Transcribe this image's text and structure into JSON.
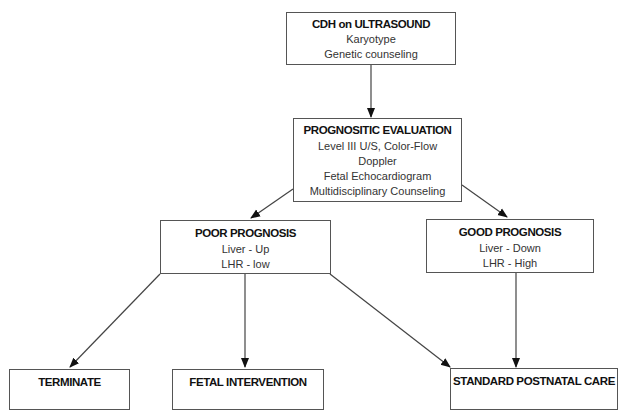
{
  "diagram": {
    "nodes": {
      "cdh": {
        "title": "CDH on ULTRASOUND",
        "lines": [
          "Karyotype",
          "Genetic counseling"
        ]
      },
      "evaluation": {
        "title": "PROGNOSITIC EVALUATION",
        "lines": [
          "Level III U/S, Color-Flow",
          "Doppler",
          "Fetal Echocardiogram",
          "Multidisciplinary Counseling"
        ]
      },
      "poor": {
        "title": "POOR PROGNOSIS",
        "lines": [
          "Liver - Up",
          "LHR - low"
        ]
      },
      "good": {
        "title": "GOOD PROGNOSIS",
        "lines": [
          "Liver - Down",
          "LHR - High"
        ]
      },
      "terminate": {
        "title": "TERMINATE"
      },
      "fetal_intervention": {
        "title": "FETAL INTERVENTION"
      },
      "postnatal": {
        "title": "STANDARD POSTNATAL CARE"
      }
    },
    "edges": [
      {
        "from": "cdh",
        "to": "evaluation"
      },
      {
        "from": "evaluation",
        "to": "poor"
      },
      {
        "from": "evaluation",
        "to": "good"
      },
      {
        "from": "poor",
        "to": "terminate"
      },
      {
        "from": "poor",
        "to": "fetal_intervention"
      },
      {
        "from": "poor",
        "to": "postnatal"
      },
      {
        "from": "good",
        "to": "postnatal"
      }
    ],
    "colors": {
      "stroke": "#555555",
      "arrow": "#111111",
      "text": "#1a1a1a"
    }
  }
}
